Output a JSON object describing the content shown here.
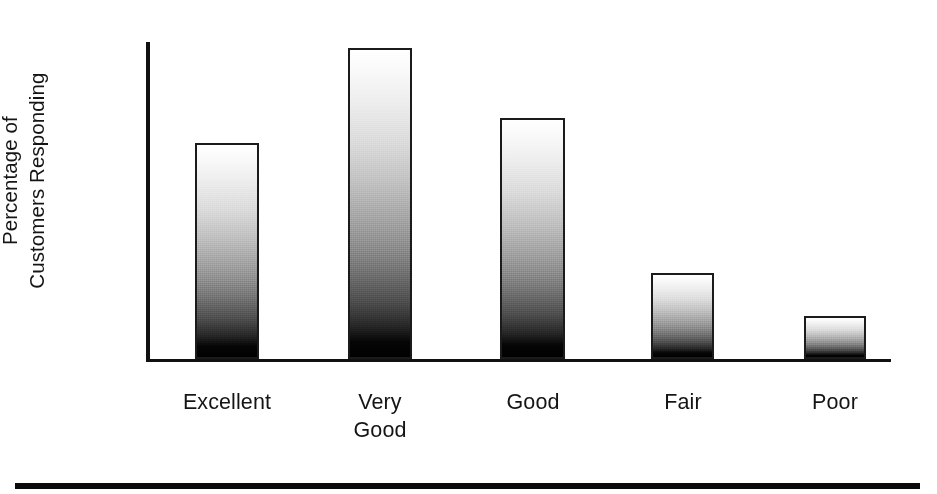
{
  "chart_data": {
    "type": "bar",
    "title": "",
    "xlabel": "",
    "ylabel": "Percentage of Customers Responding",
    "ylabel_lines": [
      "Percentage of",
      "Customers Responding"
    ],
    "categories": [
      "Excellent",
      "Very Good",
      "Good",
      "Fair",
      "Poor"
    ],
    "category_lines": [
      [
        "Excellent"
      ],
      [
        "Very",
        "Good"
      ],
      [
        "Good"
      ],
      [
        "Fair"
      ],
      [
        "Poor"
      ]
    ],
    "values": [
      68,
      98,
      76,
      27,
      14
    ],
    "value_unit": "percent of axis height",
    "ylim": [
      0,
      100
    ],
    "grid": false,
    "legend": false,
    "axis_color": "#111111",
    "bar_edge_color": "#1b1b1b",
    "bar_fill_top_color": "#ffffff",
    "bar_fill_bottom_color": "#000000",
    "bars": [
      {
        "label": "Excellent",
        "value": 68,
        "left_px": 47,
        "width_px": 64,
        "height_px": 216
      },
      {
        "label": "Very Good",
        "value": 98,
        "left_px": 200,
        "width_px": 64,
        "height_px": 311
      },
      {
        "label": "Good",
        "value": 76,
        "left_px": 352,
        "width_px": 65,
        "height_px": 241
      },
      {
        "label": "Fair",
        "value": 27,
        "left_px": 503,
        "width_px": 63,
        "height_px": 86
      },
      {
        "label": "Poor",
        "value": 14,
        "left_px": 656,
        "width_px": 62,
        "height_px": 43
      }
    ],
    "label_positions_px": [
      47,
      200,
      352,
      503,
      656
    ],
    "label_widths_px": [
      64,
      64,
      65,
      63,
      62
    ]
  }
}
